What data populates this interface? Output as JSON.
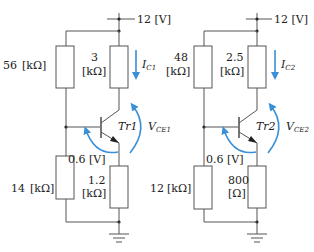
{
  "circuits": [
    {
      "supply": "12 [V]",
      "r_base_top": {
        "value": "56",
        "unit": "[kΩ]"
      },
      "r_collector": {
        "value": "3",
        "unit": "[kΩ]"
      },
      "r_base_bottom": {
        "value": "14",
        "unit": "[kΩ]"
      },
      "r_emitter": {
        "value": "1.2",
        "unit": "[kΩ]"
      },
      "vbe": "0.6 [V]",
      "transistor": "Tr1",
      "current": "I",
      "current_sub": "C1",
      "vce": "V",
      "vce_sub": "CE1"
    },
    {
      "supply": "12 [V]",
      "r_base_top": {
        "value": "48",
        "unit": "[kΩ]"
      },
      "r_collector": {
        "value": "2.5",
        "unit": "[kΩ]"
      },
      "r_base_bottom": {
        "value": "12",
        "unit": "[kΩ]"
      },
      "r_emitter": {
        "value": "800",
        "unit": "[Ω]"
      },
      "vbe": "0.6 [V]",
      "transistor": "Tr2",
      "current": "I",
      "current_sub": "C2",
      "vce": "V",
      "vce_sub": "CE2"
    }
  ],
  "colors": {
    "wire": "#555555",
    "arrow": "#3a8fd6"
  }
}
